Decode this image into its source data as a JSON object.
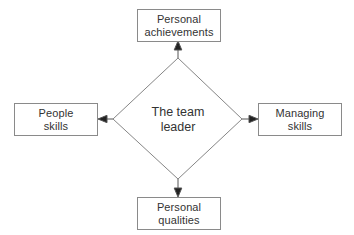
{
  "diagram": {
    "title": "The team leader",
    "type": "radial-diamond",
    "colors": {
      "background": "#ffffff",
      "stroke": "#8a8a8a",
      "edge": "#555555",
      "text": "#333333"
    },
    "center": {
      "id": "center-node",
      "label": "The team\nleader",
      "shape": "diamond"
    },
    "nodes": [
      {
        "id": "node-top",
        "label": "Personal\nachievements",
        "position": "top",
        "shape": "rectangle"
      },
      {
        "id": "node-left",
        "label": "People\nskills",
        "position": "left",
        "shape": "rectangle"
      },
      {
        "id": "node-right",
        "label": "Managing\nskills",
        "position": "right",
        "shape": "rectangle"
      },
      {
        "id": "node-bottom",
        "label": "Personal\nqualities",
        "position": "bottom",
        "shape": "rectangle"
      }
    ],
    "edges": [
      {
        "from": "center-node",
        "to": "node-top",
        "arrow": "up"
      },
      {
        "from": "center-node",
        "to": "node-left",
        "arrow": "left"
      },
      {
        "from": "center-node",
        "to": "node-right",
        "arrow": "right"
      },
      {
        "from": "center-node",
        "to": "node-bottom",
        "arrow": "down"
      }
    ]
  }
}
